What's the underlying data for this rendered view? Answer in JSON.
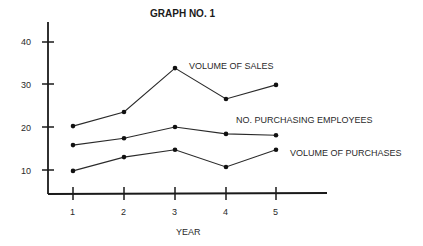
{
  "chart_data": {
    "type": "line",
    "title": "GRAPH NO. 1",
    "xlabel": "YEAR",
    "ylabel": "",
    "categories": [
      "1",
      "2",
      "3",
      "4",
      "5"
    ],
    "x": [
      1,
      2,
      3,
      4,
      5
    ],
    "yticks": [
      10,
      20,
      30,
      40
    ],
    "ylim": [
      4.5,
      43
    ],
    "grid": false,
    "legend_position": "inline-right",
    "series": [
      {
        "name": "VOLUME OF SALES",
        "values": [
          20.2,
          23.5,
          33.7,
          26.5,
          29.8
        ]
      },
      {
        "name": "NO. PURCHASING EMPLOYEES",
        "values": [
          15.8,
          17.4,
          20.0,
          18.4,
          18.1
        ]
      },
      {
        "name": "VOLUME OF PURCHASES",
        "values": [
          9.8,
          13.0,
          14.7,
          10.7,
          14.7
        ]
      }
    ]
  },
  "labels": {
    "title": "GRAPH NO. 1",
    "xlabel": "YEAR",
    "series_0": "VOLUME OF SALES",
    "series_1": "NO. PURCHASING EMPLOYEES",
    "series_2": "VOLUME OF PURCHASES",
    "ytick_10": "10",
    "ytick_20": "20",
    "ytick_30": "30",
    "ytick_40": "40",
    "xtick_1": "1",
    "xtick_2": "2",
    "xtick_3": "3",
    "xtick_4": "4",
    "xtick_5": "5"
  }
}
